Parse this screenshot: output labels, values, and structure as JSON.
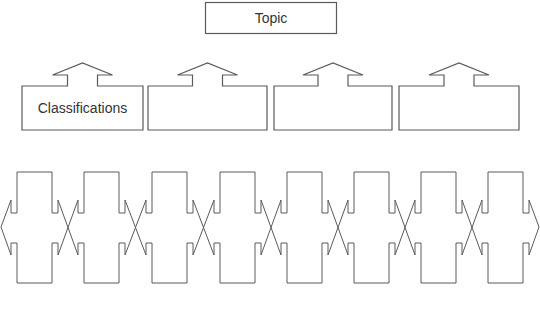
{
  "diagram": {
    "type": "classification-organizer",
    "topic": {
      "label": "Topic"
    },
    "classifications": [
      {
        "label": "Classifications"
      },
      {
        "label": ""
      },
      {
        "label": ""
      },
      {
        "label": ""
      }
    ],
    "detail_connectors": {
      "count": 8,
      "labels": [
        "",
        "",
        "",
        "",
        "",
        "",
        "",
        ""
      ]
    }
  },
  "colors": {
    "stroke": "#5a5a5a",
    "background": "#ffffff",
    "text": "#333333"
  }
}
